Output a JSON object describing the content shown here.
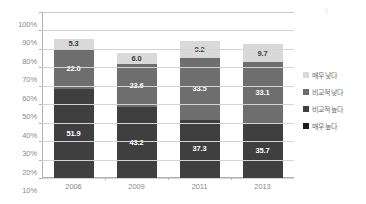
{
  "chart_data": {
    "type": "bar",
    "subtype": "stacked-100-percent-column",
    "title": "",
    "xlabel": "",
    "ylabel": "",
    "categories": [
      "2006",
      "2009",
      "2011",
      "2013"
    ],
    "ylim": [
      10,
      100
    ],
    "yticks": [
      10,
      20,
      30,
      40,
      50,
      60,
      70,
      80,
      90,
      100
    ],
    "ytick_labels": [
      "10%",
      "20%",
      "30%",
      "40%",
      "50%",
      "60%",
      "70%",
      "80%",
      "90%",
      "100%"
    ],
    "grid": true,
    "legend_position": "right",
    "stack_order_bottom_to_top": [
      "매우 높다",
      "비교적 높다",
      "비교적 낮다",
      "매우 낮다"
    ],
    "series": [
      {
        "name": "매우 높다",
        "color": "#1c1c1c",
        "label_color": "#ffffff",
        "values": [
          6.3,
          5.1,
          4.1,
          3.9
        ]
      },
      {
        "name": "비교적 높다",
        "color": "#3f3f3f",
        "label_color": "#ffffff",
        "values": [
          51.9,
          43.2,
          37.3,
          35.7
        ]
      },
      {
        "name": "비교적 낮다",
        "color": "#6e6e6e",
        "label_color": "#ffffff",
        "values": [
          22.0,
          23.6,
          33.5,
          33.1
        ]
      },
      {
        "name": "매우 낮다",
        "color": "#d9d9d9",
        "label_color": "#3c3c3c",
        "values": [
          5.3,
          6.0,
          9.2,
          9.7
        ]
      }
    ]
  },
  "legend": {
    "items": [
      {
        "label": "매우 낮다",
        "color": "#d9d9d9"
      },
      {
        "label": "비교적 낮다",
        "color": "#6e6e6e"
      },
      {
        "label": "비교적 높다",
        "color": "#3f3f3f"
      },
      {
        "label": "매우 높다",
        "color": "#1c1c1c"
      }
    ]
  },
  "colors": {
    "gridline": "#d4d4d4",
    "axis": "#b0b0b0",
    "tick_text": "#8a8a8a",
    "background": "#ffffff"
  }
}
